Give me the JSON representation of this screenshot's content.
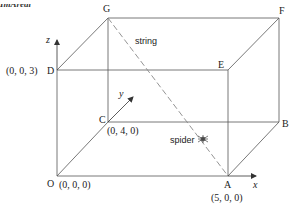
{
  "header": {
    "cut_text": "ImAreal"
  },
  "vertices": {
    "O": {
      "name": "O",
      "coord": "(0, 0, 0)"
    },
    "A": {
      "name": "A",
      "coord": "(5, 0, 0)"
    },
    "B": {
      "name": "B",
      "coord": ""
    },
    "C": {
      "name": "C",
      "coord": "(0, 4, 0)"
    },
    "D": {
      "name": "D",
      "coord": "(0, 0, 3)"
    },
    "E": {
      "name": "E",
      "coord": ""
    },
    "F": {
      "name": "F",
      "coord": ""
    },
    "G": {
      "name": "G",
      "coord": ""
    }
  },
  "axes": {
    "x": "x",
    "y": "y",
    "z": "z"
  },
  "annotations": {
    "string": "string",
    "spider": "spider",
    "spider_icon": "✱"
  },
  "colors": {
    "line": "#555555",
    "dashed": "#888888",
    "text": "#222222"
  }
}
